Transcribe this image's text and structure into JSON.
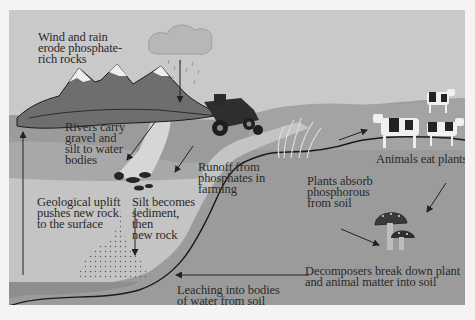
{
  "diagram": {
    "colors": {
      "sky": "#c9c9c9",
      "ground": "#9b9b9b",
      "sediment": "#c6c6c6",
      "bedrock_band": "#8e8e8e",
      "mountain": "#6e6e6e",
      "snow": "#eeeeee",
      "text": "#2a2a2a",
      "arrow": "#222222"
    },
    "labels": {
      "wind_rain": "Wind and rain\nerode phosphate-\nrich rocks",
      "rivers": "Rivers carry\ngravel and\nsilt to water\nbodies",
      "runoff": "Runoff from\nphosphates in\nfarming",
      "animals": "Animals eat plants",
      "plants": "Plants absorb\nphosphorous\nfrom soil",
      "uplift": "Geological uplift\npushes new rock\nto the surface",
      "silt": "Silt becomes\nsediment,\nthen\nnew rock",
      "decomposers": "Decomposers break down plant\nand animal matter into soil",
      "leaching": "Leaching into bodies\nof water from soil"
    },
    "illustrations": [
      "rain-cloud",
      "mountains",
      "tractor",
      "plants",
      "cows",
      "mushrooms",
      "rock-pile",
      "river",
      "sediment-dots"
    ]
  }
}
